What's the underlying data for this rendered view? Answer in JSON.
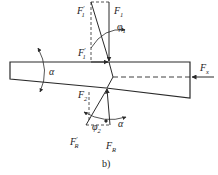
{
  "diagram": {
    "caption": "b)",
    "colors": {
      "line": "#2a2a2a",
      "background": "#ffffff"
    },
    "labels": {
      "f1_prime_top": {
        "main": "F",
        "sub": "1",
        "prime": "′"
      },
      "f1": {
        "main": "F",
        "sub": "1"
      },
      "phi1": {
        "main": "φ",
        "sub": "1"
      },
      "f1_prime_mid": {
        "main": "F",
        "sub": "1",
        "prime": "′"
      },
      "alpha_left": {
        "main": "α"
      },
      "fx": {
        "main": "F",
        "sub": "x"
      },
      "f2": {
        "main": "F",
        "sub": "2"
      },
      "phi2": {
        "main": "φ",
        "sub": "2"
      },
      "alpha_bottom": {
        "main": "α"
      },
      "fr_prime": {
        "main": "F",
        "sub": "R",
        "prime": "′"
      },
      "fr": {
        "main": "F",
        "sub": "R"
      }
    }
  }
}
